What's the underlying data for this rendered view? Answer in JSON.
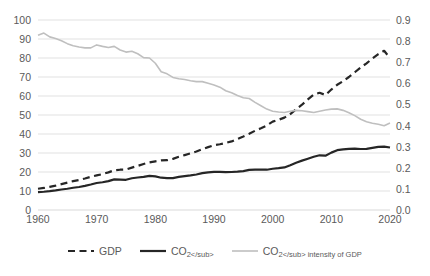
{
  "chart_data": {
    "type": "line",
    "title": "",
    "xlabel": "",
    "ylabel": "",
    "grid": true,
    "legend_position": "bottom",
    "x": [
      1960,
      1961,
      1962,
      1963,
      1964,
      1965,
      1966,
      1967,
      1968,
      1969,
      1970,
      1971,
      1972,
      1973,
      1974,
      1975,
      1976,
      1977,
      1978,
      1979,
      1980,
      1981,
      1982,
      1983,
      1984,
      1985,
      1986,
      1987,
      1988,
      1989,
      1990,
      1991,
      1992,
      1993,
      1994,
      1995,
      1996,
      1997,
      1998,
      1999,
      2000,
      2001,
      2002,
      2003,
      2004,
      2005,
      2006,
      2007,
      2008,
      2009,
      2010,
      2011,
      2012,
      2013,
      2014,
      2015,
      2016,
      2017,
      2018,
      2019,
      2020
    ],
    "x_tick_labels": [
      "1960",
      "1970",
      "1980",
      "1990",
      "2000",
      "2010",
      "2020"
    ],
    "x_ticks": [
      1960,
      1970,
      1980,
      1990,
      2000,
      2010,
      2020
    ],
    "xlim": [
      1960,
      2020
    ],
    "axes": [
      {
        "id": "left",
        "position": "left",
        "ylim": [
          0,
          100
        ],
        "ytick_labels": [
          "0",
          "10",
          "20",
          "30",
          "40",
          "50",
          "60",
          "70",
          "80",
          "90",
          "100"
        ],
        "yticks": [
          0,
          10,
          20,
          30,
          40,
          50,
          60,
          70,
          80,
          90,
          100
        ]
      },
      {
        "id": "right",
        "position": "right",
        "ylim": [
          0.0,
          0.9
        ],
        "ytick_labels": [
          "0.0",
          "0.1",
          "0.2",
          "0.3",
          "0.4",
          "0.5",
          "0.6",
          "0.7",
          "0.8",
          "0.9"
        ],
        "yticks": [
          0.0,
          0.1,
          0.2,
          0.3,
          0.4,
          0.5,
          0.6,
          0.7,
          0.8,
          0.9
        ]
      }
    ],
    "series": [
      {
        "name": "GDP",
        "legend_label": "GDP",
        "axis": "left",
        "style": "dashed",
        "color": "#262626",
        "width": 2.2,
        "values": [
          11.2,
          11.6,
          12.2,
          12.8,
          13.6,
          14.4,
          15.2,
          15.8,
          16.6,
          17.5,
          18.2,
          18.9,
          19.8,
          20.9,
          21.2,
          21.3,
          22.3,
          23.2,
          24.2,
          25.1,
          25.6,
          26.1,
          26.2,
          26.9,
          28.0,
          28.9,
          29.8,
          30.8,
          32.0,
          33.1,
          34.1,
          34.6,
          35.3,
          36.1,
          37.4,
          38.7,
          40.1,
          41.7,
          43.0,
          44.5,
          46.5,
          47.5,
          48.6,
          50.5,
          53.0,
          55.4,
          58.2,
          60.7,
          61.7,
          60.5,
          63.4,
          65.9,
          67.8,
          70.0,
          72.5,
          75.0,
          77.2,
          79.7,
          82.0,
          83.8,
          80.0
        ]
      },
      {
        "name": "CO2",
        "legend_label": "CO₂",
        "axis": "left",
        "style": "solid",
        "color": "#262626",
        "width": 2.2,
        "values": [
          9.4,
          9.6,
          9.9,
          10.3,
          10.8,
          11.2,
          11.7,
          12.1,
          12.7,
          13.4,
          14.2,
          14.6,
          15.2,
          16.1,
          16.0,
          15.9,
          16.7,
          17.1,
          17.4,
          18.0,
          17.7,
          17.0,
          16.8,
          16.8,
          17.4,
          17.8,
          18.2,
          18.7,
          19.4,
          19.8,
          20.1,
          20.1,
          19.9,
          20.0,
          20.2,
          20.5,
          21.1,
          21.2,
          21.2,
          21.2,
          21.7,
          22.0,
          22.4,
          23.6,
          24.9,
          26.0,
          27.0,
          28.0,
          28.8,
          28.6,
          30.2,
          31.5,
          31.9,
          32.2,
          32.3,
          32.1,
          32.2,
          32.7,
          33.2,
          33.4,
          32.9
        ]
      },
      {
        "name": "CO2 intensity of GDP",
        "legend_label": "CO₂ intensity of GDP",
        "axis": "right",
        "style": "solid",
        "color": "#bfbfbf",
        "width": 1.6,
        "values": [
          0.828,
          0.838,
          0.82,
          0.812,
          0.802,
          0.788,
          0.778,
          0.772,
          0.768,
          0.768,
          0.782,
          0.775,
          0.77,
          0.775,
          0.758,
          0.748,
          0.752,
          0.74,
          0.722,
          0.72,
          0.695,
          0.655,
          0.645,
          0.628,
          0.622,
          0.618,
          0.612,
          0.608,
          0.608,
          0.6,
          0.592,
          0.582,
          0.565,
          0.555,
          0.542,
          0.532,
          0.528,
          0.51,
          0.494,
          0.478,
          0.468,
          0.464,
          0.462,
          0.468,
          0.472,
          0.47,
          0.466,
          0.462,
          0.468,
          0.474,
          0.478,
          0.479,
          0.472,
          0.461,
          0.447,
          0.43,
          0.418,
          0.411,
          0.406,
          0.399,
          0.412
        ]
      }
    ]
  }
}
